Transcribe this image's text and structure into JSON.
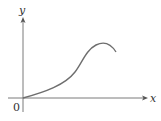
{
  "diagram": {
    "type": "function-graph",
    "axes": {
      "x_label": "x",
      "y_label": "y",
      "origin_label": "0"
    },
    "colors": {
      "axis": "#7a7a7a",
      "curve": "#6e6e6e",
      "text": "#333333"
    },
    "curve": {
      "description": "increasing curve starting at origin, concave up then inflecting, rising to a local maximum and then decreasing slightly",
      "features": [
        "passes through origin",
        "inflection point",
        "local maximum"
      ]
    }
  }
}
